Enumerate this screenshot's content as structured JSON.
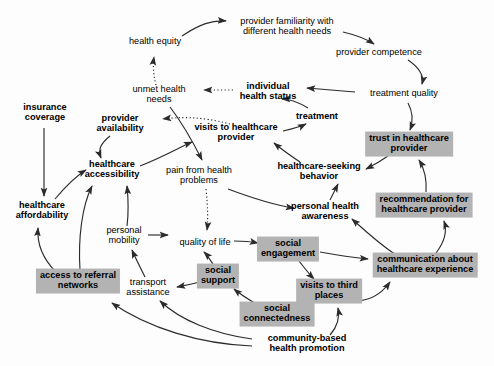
{
  "diagram": {
    "background_color": "#fdfdfd",
    "shaded_node_color": "#b3b3b3",
    "edge_color": "#333333",
    "nodes": [
      {
        "id": "health_equity",
        "label": "health equity",
        "style": "plain",
        "x": 155,
        "y": 42
      },
      {
        "id": "provider_familiarity",
        "label": "provider familiarity with\ndifferent health needs",
        "style": "plain",
        "x": 287,
        "y": 27
      },
      {
        "id": "provider_competence",
        "label": "provider competence",
        "style": "plain",
        "x": 379,
        "y": 53
      },
      {
        "id": "unmet_health_needs",
        "label": "unmet health\nneeds",
        "style": "plain",
        "x": 159,
        "y": 95
      },
      {
        "id": "individual_health_status",
        "label": "individual\nhealth status",
        "style": "bold",
        "x": 268,
        "y": 92
      },
      {
        "id": "treatment_quality",
        "label": "treatment quality",
        "style": "plain",
        "x": 404,
        "y": 94
      },
      {
        "id": "insurance_coverage",
        "label": "insurance\ncoverage",
        "style": "bold",
        "x": 45,
        "y": 113
      },
      {
        "id": "provider_availability",
        "label": "provider\navailability",
        "style": "bold",
        "x": 120,
        "y": 124
      },
      {
        "id": "visits_to_healthcare_provider",
        "label": "visits to healthcare\nprovider",
        "style": "bold",
        "x": 236,
        "y": 133
      },
      {
        "id": "treatment",
        "label": "treatment",
        "style": "bold",
        "x": 317,
        "y": 117
      },
      {
        "id": "trust_in_healthcare_provider",
        "label": "trust in healthcare\nprovider",
        "style": "boxed",
        "x": 409,
        "y": 144
      },
      {
        "id": "healthcare_accessibility",
        "label": "healthcare\naccessibility",
        "style": "bold",
        "x": 112,
        "y": 170
      },
      {
        "id": "pain_from_health_problems",
        "label": "pain from health\nproblems",
        "style": "plain",
        "x": 199,
        "y": 176
      },
      {
        "id": "healthcare_seeking_behavior",
        "label": "healthcare-seeking\nbehavior",
        "style": "bold",
        "x": 319,
        "y": 172
      },
      {
        "id": "recommendation_for_healthcare_provider",
        "label": "recommendation for\nhealthcare provider",
        "style": "boxed",
        "x": 424,
        "y": 205
      },
      {
        "id": "healthcare_affordability",
        "label": "healthcare\naffordability",
        "style": "bold",
        "x": 42,
        "y": 211
      },
      {
        "id": "personal_health_awareness",
        "label": "personal health\nawareness",
        "style": "bold",
        "x": 325,
        "y": 212
      },
      {
        "id": "personal_mobility",
        "label": "personal\nmobility",
        "style": "plain",
        "x": 124,
        "y": 236
      },
      {
        "id": "quality_of_life",
        "label": "quality of life",
        "style": "plain",
        "x": 205,
        "y": 243
      },
      {
        "id": "social_engagement",
        "label": "social\nengagement",
        "style": "boxed",
        "x": 288,
        "y": 249
      },
      {
        "id": "communication_about_healthcare_experience",
        "label": "communication about\nhealthcare experience",
        "style": "boxed",
        "x": 425,
        "y": 265
      },
      {
        "id": "access_to_referral_networks",
        "label": "access to referral\nnetworks",
        "style": "boxed",
        "x": 78,
        "y": 281
      },
      {
        "id": "transport_assistance",
        "label": "transport\nassistance",
        "style": "plain",
        "x": 148,
        "y": 288
      },
      {
        "id": "social_support",
        "label": "social\nsupport",
        "style": "boxed",
        "x": 218,
        "y": 276
      },
      {
        "id": "visits_to_third_places",
        "label": "visits to third\nplaces",
        "style": "boxed",
        "x": 329,
        "y": 291
      },
      {
        "id": "social_connectedness",
        "label": "social\nconnectedness",
        "style": "boxed",
        "x": 277,
        "y": 314
      },
      {
        "id": "community_based_health_promotion",
        "label": "community-based\nhealth promotion",
        "style": "bold",
        "x": 307,
        "y": 344
      }
    ],
    "edges": [
      {
        "from": "health_equity",
        "to": "provider_familiarity",
        "line": "solid"
      },
      {
        "from": "provider_familiarity",
        "to": "provider_competence",
        "line": "solid"
      },
      {
        "from": "provider_competence",
        "to": "treatment_quality",
        "line": "solid"
      },
      {
        "from": "treatment_quality",
        "to": "individual_health_status",
        "line": "solid"
      },
      {
        "from": "treatment_quality",
        "to": "trust_in_healthcare_provider",
        "line": "solid"
      },
      {
        "from": "unmet_health_needs",
        "to": "health_equity",
        "line": "dotted"
      },
      {
        "from": "individual_health_status",
        "to": "unmet_health_needs",
        "line": "dotted"
      },
      {
        "from": "visits_to_healthcare_provider",
        "to": "provider_availability",
        "line": "dotted"
      },
      {
        "from": "unmet_health_needs",
        "to": "pain_from_health_problems",
        "line": "solid"
      },
      {
        "from": "provider_availability",
        "to": "healthcare_accessibility",
        "line": "solid"
      },
      {
        "from": "healthcare_accessibility",
        "to": "visits_to_healthcare_provider",
        "line": "solid"
      },
      {
        "from": "visits_to_healthcare_provider",
        "to": "treatment",
        "line": "solid"
      },
      {
        "from": "treatment",
        "to": "individual_health_status",
        "line": "solid"
      },
      {
        "from": "healthcare_seeking_behavior",
        "to": "visits_to_healthcare_provider",
        "line": "solid"
      },
      {
        "from": "trust_in_healthcare_provider",
        "to": "healthcare_seeking_behavior",
        "line": "solid"
      },
      {
        "from": "insurance_coverage",
        "to": "healthcare_affordability",
        "line": "solid"
      },
      {
        "from": "healthcare_affordability",
        "to": "healthcare_accessibility",
        "line": "solid"
      },
      {
        "from": "pain_from_health_problems",
        "to": "personal_health_awareness",
        "line": "solid"
      },
      {
        "from": "pain_from_health_problems",
        "to": "quality_of_life",
        "line": "dotted"
      },
      {
        "from": "personal_health_awareness",
        "to": "healthcare_seeking_behavior",
        "line": "solid"
      },
      {
        "from": "communication_about_healthcare_experience",
        "to": "personal_health_awareness",
        "line": "solid"
      },
      {
        "from": "communication_about_healthcare_experience",
        "to": "recommendation_for_healthcare_provider",
        "line": "solid"
      },
      {
        "from": "recommendation_for_healthcare_provider",
        "to": "trust_in_healthcare_provider",
        "line": "solid"
      },
      {
        "from": "social_engagement",
        "to": "communication_about_healthcare_experience",
        "line": "solid"
      },
      {
        "from": "social_engagement",
        "to": "visits_to_third_places",
        "line": "solid"
      },
      {
        "from": "quality_of_life",
        "to": "social_engagement",
        "line": "solid"
      },
      {
        "from": "personal_mobility",
        "to": "quality_of_life",
        "line": "solid"
      },
      {
        "from": "personal_mobility",
        "to": "healthcare_accessibility",
        "line": "solid"
      },
      {
        "from": "access_to_referral_networks",
        "to": "healthcare_affordability",
        "line": "solid"
      },
      {
        "from": "access_to_referral_networks",
        "to": "healthcare_accessibility",
        "line": "solid"
      },
      {
        "from": "transport_assistance",
        "to": "personal_mobility",
        "line": "solid"
      },
      {
        "from": "social_support",
        "to": "transport_assistance",
        "line": "solid"
      },
      {
        "from": "social_support",
        "to": "quality_of_life",
        "line": "solid"
      },
      {
        "from": "social_connectedness",
        "to": "social_support",
        "line": "solid"
      },
      {
        "from": "visits_to_third_places",
        "to": "social_connectedness",
        "line": "solid"
      },
      {
        "from": "visits_to_third_places",
        "to": "communication_about_healthcare_experience",
        "line": "solid"
      },
      {
        "from": "community_based_health_promotion",
        "to": "visits_to_third_places",
        "line": "solid"
      },
      {
        "from": "community_based_health_promotion",
        "to": "transport_assistance",
        "line": "solid"
      },
      {
        "from": "community_based_health_promotion",
        "to": "access_to_referral_networks",
        "line": "solid"
      }
    ]
  }
}
